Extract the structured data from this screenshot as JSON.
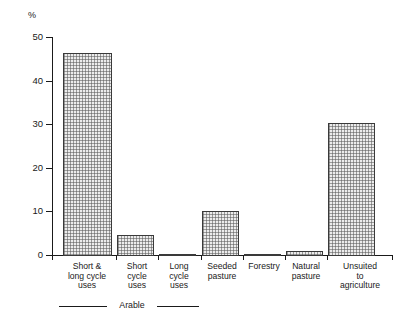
{
  "chart_data": {
    "type": "bar",
    "title": "",
    "subtitle": "",
    "xlabel": "",
    "ylabel": "%",
    "ylim": [
      0,
      50
    ],
    "ytick_labels": [
      "0",
      "10",
      "20",
      "30",
      "40",
      "50"
    ],
    "ytick_values": [
      0,
      10,
      20,
      30,
      40,
      50
    ],
    "grid": false,
    "legend": null,
    "categories": [
      "Short &\nlong cycle\nuses",
      "Short\ncycle\nuses",
      "Long\ncycle\nuses",
      "Seeded\npasture",
      "Forestry",
      "Natural\npasture",
      "Unsuited\nto\nagriculture"
    ],
    "values": [
      46.6,
      4.8,
      0.4,
      10.4,
      0.4,
      1.1,
      30.5
    ],
    "annotations": [
      {
        "label": "Arable",
        "spans_categories": [
          0,
          1,
          2
        ]
      }
    ],
    "bar_fill_color": "#ececec",
    "bar_edge_color": "#3a3a3a",
    "axis_color": "#1a1a1a"
  }
}
